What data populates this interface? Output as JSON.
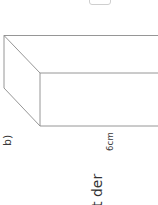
{
  "page": {
    "exercise_label": "b)",
    "dimension_label": "6cm",
    "text_fragment": "t der"
  },
  "figure": {
    "type": "cuboid",
    "stroke_color": "#8a8a8a",
    "background": "#ffffff"
  }
}
